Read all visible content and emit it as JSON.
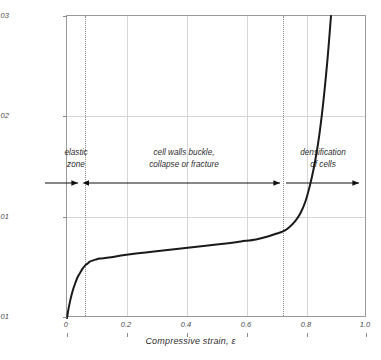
{
  "chart_data": {
    "type": "line",
    "title": "",
    "xlabel": "Compressive strain, ε",
    "ylabel": "Compressive stress, σ (MPa)",
    "xlim": [
      0,
      1.0
    ],
    "ylim": [
      0,
      0.03
    ],
    "grid": true,
    "legend": "none",
    "line_color": "#1a1a1a",
    "grid_color": "#d6d6d6",
    "frame_color": "#9a9a9a",
    "xticks": [
      "0",
      "0.2",
      "0.4",
      "0.6",
      "0.8",
      "1.0"
    ],
    "xtick_values": [
      0,
      0.2,
      0.4,
      0.6,
      0.8,
      1.0
    ],
    "yticks": [
      "0.01",
      "0.01",
      "0.02",
      "0.03"
    ],
    "ytick_values": [
      0,
      0.01,
      0.02,
      0.03
    ],
    "series": [
      {
        "name": "compressive stress-strain",
        "x": [
          0.0,
          0.005,
          0.012,
          0.02,
          0.028,
          0.036,
          0.044,
          0.052,
          0.06,
          0.068,
          0.076,
          0.085,
          0.095,
          0.11,
          0.14,
          0.18,
          0.23,
          0.29,
          0.35,
          0.41,
          0.47,
          0.53,
          0.58,
          0.63,
          0.67,
          0.7,
          0.72,
          0.74,
          0.76,
          0.778,
          0.795,
          0.81,
          0.822,
          0.833,
          0.842,
          0.85,
          0.857,
          0.863,
          0.868,
          0.872,
          0.876,
          0.88
        ],
        "y": [
          0.0,
          0.0009,
          0.0019,
          0.0028,
          0.0035,
          0.0041,
          0.0045,
          0.0049,
          0.0052,
          0.0054,
          0.0056,
          0.0057,
          0.0058,
          0.0059,
          0.006,
          0.0062,
          0.0064,
          0.0066,
          0.0068,
          0.007,
          0.0072,
          0.0074,
          0.0076,
          0.0078,
          0.0081,
          0.0084,
          0.0086,
          0.009,
          0.0096,
          0.0104,
          0.0116,
          0.0132,
          0.0148,
          0.0166,
          0.0184,
          0.0203,
          0.0222,
          0.024,
          0.0256,
          0.027,
          0.0285,
          0.03
        ]
      }
    ],
    "annotations": [
      {
        "name": "elastic-zone",
        "text_line1": "elastic",
        "text_line2": "zone",
        "x_center": 0.03,
        "x_start": 0.0,
        "x_end": 0.06
      },
      {
        "name": "cell-walls-buckle",
        "text_line1": "cell walls buckle,",
        "text_line2": "collapse or fracture",
        "x_center": 0.39,
        "x_start": 0.06,
        "x_end": 0.72
      },
      {
        "name": "densification-of-cells",
        "text_line1": "densification",
        "text_line2": "of cells",
        "x_center": 0.855,
        "x_start": 0.72,
        "x_end": 1.0
      }
    ],
    "dividers": [
      0.06,
      0.72
    ],
    "arrow_row_y_fraction": 0.553
  }
}
